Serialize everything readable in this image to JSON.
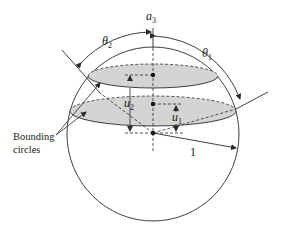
{
  "diagram": {
    "axis_label": {
      "symbol": "a",
      "subscript": "3"
    },
    "angle_labels": [
      {
        "symbol": "θ",
        "subscript": "2"
      },
      {
        "symbol": "θ",
        "subscript": "1"
      }
    ],
    "height_labels": [
      {
        "symbol": "u",
        "subscript": "2"
      },
      {
        "symbol": "u",
        "subscript": "1"
      }
    ],
    "radius_label": "1",
    "callout": {
      "line1": "Bounding",
      "line2": "circles"
    },
    "colors": {
      "stroke": "#2a2a2a",
      "disc_fill": "#d4d4d4",
      "background": "#ffffff"
    }
  }
}
